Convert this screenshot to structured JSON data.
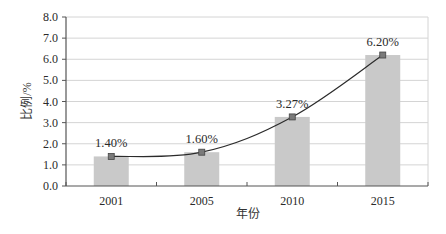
{
  "chart_data": {
    "type": "bar",
    "title": "",
    "xlabel": "年份",
    "ylabel": "比例/%",
    "categories": [
      "2001",
      "2005",
      "2010",
      "2015"
    ],
    "series": [
      {
        "name": "比例 (bar)",
        "type": "bar",
        "values": [
          1.4,
          1.6,
          3.27,
          6.2
        ],
        "color": "#c9c9c9"
      },
      {
        "name": "比例 (line)",
        "type": "line",
        "values": [
          1.4,
          1.6,
          3.27,
          6.2
        ],
        "color": "#2b2b2b",
        "marker": "square"
      }
    ],
    "data_labels": [
      "1.40%",
      "1.60%",
      "3.27%",
      "6.20%"
    ],
    "ylim": [
      0,
      8
    ],
    "yticks": [
      "0.0",
      "1.0",
      "2.0",
      "3.0",
      "4.0",
      "5.0",
      "6.0",
      "7.0",
      "8.0"
    ],
    "grid": true,
    "legend": null
  }
}
